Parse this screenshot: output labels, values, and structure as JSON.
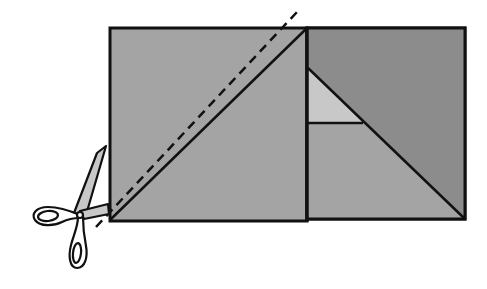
{
  "diagram": {
    "colors": {
      "background": "#ffffff",
      "outline": "#111111",
      "medium_gray": "#a4a4a4",
      "dark_gray": "#8c8c8c",
      "light_gray": "#c8c8c8",
      "scissors_blade": "#c8c8c8",
      "scissors_handle": "#ffffff"
    },
    "left_square": {
      "x": 110,
      "y": 28,
      "w": 197,
      "h": 193,
      "fill": "medium_gray"
    },
    "left_diagonal": {
      "x1": 110,
      "y1": 220,
      "x2": 306,
      "y2": 29
    },
    "cut_line": {
      "x1": 96,
      "y1": 227,
      "x2": 297,
      "y2": 12,
      "style": "dashed"
    },
    "right_square": {
      "x": 307,
      "y": 28,
      "w": 158,
      "h": 191,
      "pieces": [
        {
          "name": "dark-triangle",
          "fill": "dark_gray"
        },
        {
          "name": "light-triangle",
          "fill": "light_gray"
        },
        {
          "name": "medium-trapezoid",
          "fill": "medium_gray"
        }
      ],
      "diagonal": {
        "x1": 308,
        "y1": 68,
        "x2": 465,
        "y2": 219
      },
      "seam": {
        "x1": 308,
        "y1": 123,
        "x2": 363,
        "y2": 123
      }
    },
    "scissors": {
      "pivot_x": 80,
      "pivot_y": 215
    }
  }
}
